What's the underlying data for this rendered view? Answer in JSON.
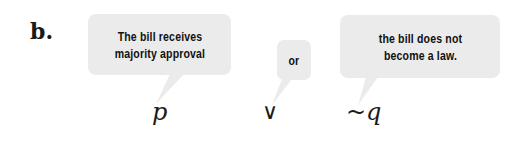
{
  "label": "b.",
  "bubbles": [
    {
      "text": "The bill receives\nmajority approval",
      "role": "statement-p"
    },
    {
      "text": "or",
      "role": "connective"
    },
    {
      "text": "the bill does not\nbecome a law.",
      "role": "statement-not-q"
    }
  ],
  "symbols": {
    "p": "p",
    "or": "∨",
    "not_q": "~q"
  },
  "colors": {
    "bubble_fill": "#ebebeb",
    "text": "#111111",
    "background": "#ffffff"
  }
}
